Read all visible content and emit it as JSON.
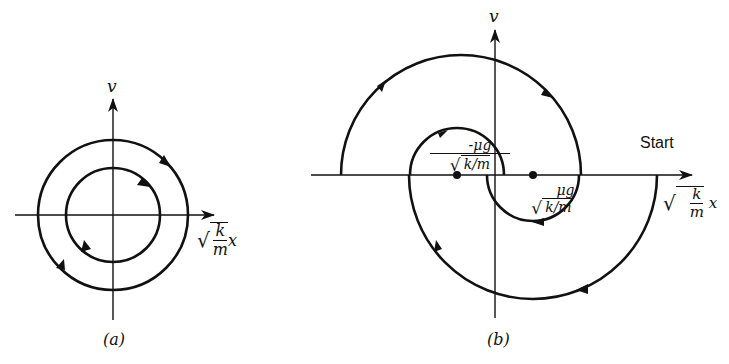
{
  "panel_a": {
    "caption": "(a)",
    "y_axis_label": "v",
    "x_axis_label": {
      "radical": "√",
      "numerator": "k",
      "denominator": "m",
      "variable": "x"
    },
    "curves": [
      {
        "type": "circle",
        "name": "outer",
        "center": [
          113,
          215
        ],
        "radius": 75,
        "direction": "clockwise"
      },
      {
        "type": "circle",
        "name": "inner",
        "center": [
          113,
          215
        ],
        "radius": 47,
        "direction": "clockwise"
      }
    ]
  },
  "panel_b": {
    "caption": "(b)",
    "y_axis_label": "v",
    "start_label": "Start",
    "x_axis_label": {
      "radical": "√",
      "numerator": "k",
      "denominator": "m",
      "variable": "x"
    },
    "left_point_label": {
      "numerator": "-μg",
      "denominator": "k/m"
    },
    "right_point_label": {
      "numerator": "μg",
      "denominator": "k/m"
    },
    "points": [
      {
        "name": "left-equilibrium",
        "x": 457,
        "y": 175
      },
      {
        "name": "right-equilibrium",
        "x": 533,
        "y": 175
      }
    ],
    "curves": [
      {
        "name": "large-lower-arc",
        "center": [
          533,
          175
        ],
        "radius": 124,
        "from": "Start"
      },
      {
        "name": "large-upper-arc",
        "center": [
          461,
          175
        ],
        "radius": 120
      },
      {
        "name": "small-upper-arc",
        "center": [
          457,
          175
        ],
        "radius": 47
      },
      {
        "name": "small-lower-arc",
        "center": [
          533,
          175
        ],
        "radius": 46
      }
    ]
  }
}
